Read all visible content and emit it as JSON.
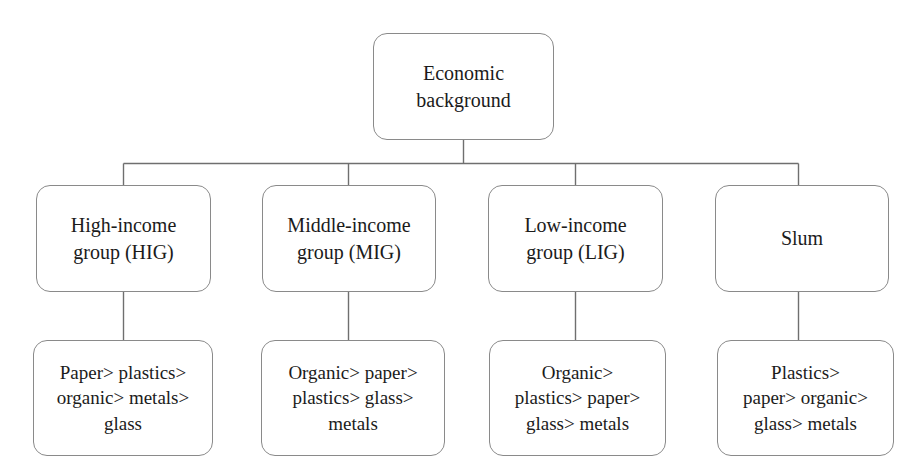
{
  "diagram": {
    "type": "tree",
    "title": "Economic background",
    "root": {
      "id": "economic-background",
      "label": "Economic\nbackground"
    },
    "groups": [
      {
        "id": "hig",
        "label": "High-income\ngroup (HIG)",
        "ranking": "Paper> plastics>\norganic> metals>\nglass"
      },
      {
        "id": "mig",
        "label": "Middle-income\ngroup (MIG)",
        "ranking": "Organic> paper>\nplastics> glass>\nmetals"
      },
      {
        "id": "lig",
        "label": "Low-income\ngroup (LIG)",
        "ranking": "Organic>\nplastics> paper>\nglass> metals"
      },
      {
        "id": "slum",
        "label": "Slum",
        "ranking": "Plastics>\npaper> organic>\nglass> metals"
      }
    ],
    "colors": {
      "background": "#ffffff",
      "node_border": "#8a8a8a",
      "node_fill": "#ffffff",
      "connector": "#6f6f6f",
      "text": "#1b1b1b"
    }
  }
}
